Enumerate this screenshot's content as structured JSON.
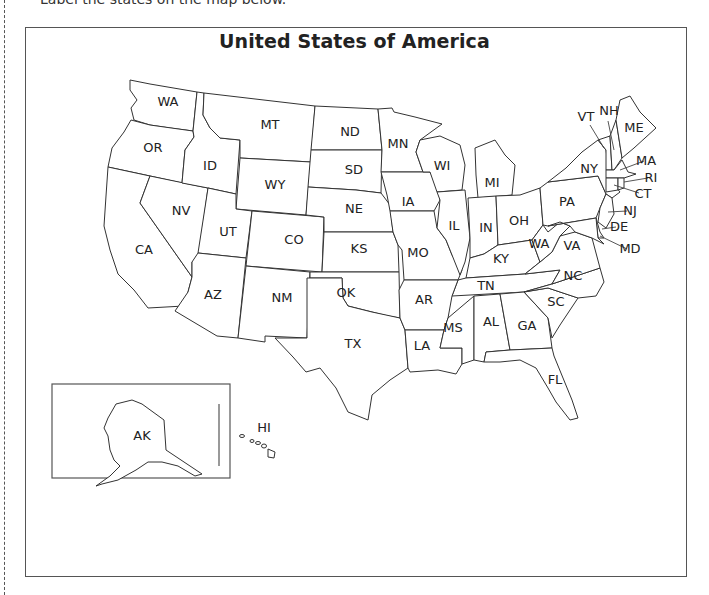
{
  "page": {
    "cut_off_text": "Label the states on the map below.",
    "title": "United States of America"
  },
  "map": {
    "frame": {
      "x": 25,
      "y": 27,
      "w": 662,
      "h": 550
    },
    "labels": [
      {
        "abbr": "WA",
        "x": 168,
        "y": 106
      },
      {
        "abbr": "OR",
        "x": 153,
        "y": 152
      },
      {
        "abbr": "ID",
        "x": 210,
        "y": 170
      },
      {
        "abbr": "MT",
        "x": 270,
        "y": 129
      },
      {
        "abbr": "WY",
        "x": 275,
        "y": 189
      },
      {
        "abbr": "ND",
        "x": 350,
        "y": 136
      },
      {
        "abbr": "SD",
        "x": 354,
        "y": 174
      },
      {
        "abbr": "NE",
        "x": 354,
        "y": 213
      },
      {
        "abbr": "MN",
        "x": 398,
        "y": 148
      },
      {
        "abbr": "WI",
        "x": 442,
        "y": 170
      },
      {
        "abbr": "MI",
        "x": 492,
        "y": 187
      },
      {
        "abbr": "IA",
        "x": 408,
        "y": 206
      },
      {
        "abbr": "IL",
        "x": 454,
        "y": 230
      },
      {
        "abbr": "IN",
        "x": 486,
        "y": 232
      },
      {
        "abbr": "OH",
        "x": 519,
        "y": 225
      },
      {
        "abbr": "NV",
        "x": 181,
        "y": 215
      },
      {
        "abbr": "UT",
        "x": 228,
        "y": 236
      },
      {
        "abbr": "CO",
        "x": 294,
        "y": 244
      },
      {
        "abbr": "KS",
        "x": 359,
        "y": 253
      },
      {
        "abbr": "MO",
        "x": 418,
        "y": 257
      },
      {
        "abbr": "KY",
        "x": 501,
        "y": 263
      },
      {
        "abbr": "WA",
        "x": 539,
        "y": 248
      },
      {
        "abbr": "VA",
        "x": 572,
        "y": 250
      },
      {
        "abbr": "CA",
        "x": 144,
        "y": 254
      },
      {
        "abbr": "AZ",
        "x": 213,
        "y": 299
      },
      {
        "abbr": "NM",
        "x": 282,
        "y": 302
      },
      {
        "abbr": "OK",
        "x": 346,
        "y": 297
      },
      {
        "abbr": "AR",
        "x": 424,
        "y": 304
      },
      {
        "abbr": "TN",
        "x": 486,
        "y": 290
      },
      {
        "abbr": "NC",
        "x": 573,
        "y": 280
      },
      {
        "abbr": "SC",
        "x": 556,
        "y": 306
      },
      {
        "abbr": "MS",
        "x": 453,
        "y": 332
      },
      {
        "abbr": "AL",
        "x": 491,
        "y": 326
      },
      {
        "abbr": "GA",
        "x": 527,
        "y": 330
      },
      {
        "abbr": "LA",
        "x": 422,
        "y": 350
      },
      {
        "abbr": "TX",
        "x": 353,
        "y": 348
      },
      {
        "abbr": "FL",
        "x": 555,
        "y": 384
      },
      {
        "abbr": "NY",
        "x": 589,
        "y": 173
      },
      {
        "abbr": "PA",
        "x": 567,
        "y": 206
      },
      {
        "abbr": "VT",
        "x": 586,
        "y": 121
      },
      {
        "abbr": "NH",
        "x": 609,
        "y": 115
      },
      {
        "abbr": "ME",
        "x": 634,
        "y": 132
      },
      {
        "abbr": "MA",
        "x": 646,
        "y": 165
      },
      {
        "abbr": "RI",
        "x": 651,
        "y": 182
      },
      {
        "abbr": "CT",
        "x": 643,
        "y": 198
      },
      {
        "abbr": "NJ",
        "x": 630,
        "y": 215
      },
      {
        "abbr": "DE",
        "x": 619,
        "y": 231
      },
      {
        "abbr": "MD",
        "x": 630,
        "y": 253
      },
      {
        "abbr": "AK",
        "x": 142,
        "y": 440
      },
      {
        "abbr": "HI",
        "x": 264,
        "y": 432
      }
    ],
    "inset": {
      "x": 52,
      "y": 384,
      "w": 178,
      "h": 94
    },
    "colors": {
      "line": "#333333",
      "frame": "#555555",
      "text": "#222222",
      "background": "#ffffff"
    }
  }
}
